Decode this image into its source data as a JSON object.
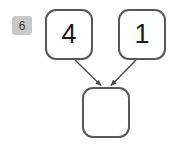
{
  "canvas": {
    "width": 176,
    "height": 152,
    "background": "#ffffff"
  },
  "badge": {
    "name": "step-badge",
    "label": "6",
    "background": "#c9c9c9",
    "text_color": "#3a3a3a"
  },
  "diagram": {
    "type": "node-graph",
    "node_style": {
      "fill": "#ffffff",
      "stroke": "#58585a",
      "stroke_width": 2,
      "corner_radius": 11,
      "text_color": "#1a1a1a"
    },
    "edge_style": {
      "stroke": "#4a4a4a",
      "stroke_width": 1.4,
      "arrowhead": "filled-triangle"
    },
    "nodes": [
      {
        "id": "left",
        "label": "4",
        "x": 45,
        "y": 9,
        "w": 48,
        "h": 51
      },
      {
        "id": "right",
        "label": "1",
        "x": 118,
        "y": 9,
        "w": 48,
        "h": 51
      },
      {
        "id": "out",
        "label": "",
        "x": 82,
        "y": 87,
        "w": 48,
        "h": 51
      }
    ],
    "edges": [
      {
        "from": "left",
        "to": "out",
        "x1": 75,
        "y1": 60,
        "x2": 102,
        "y2": 87
      },
      {
        "from": "right",
        "to": "out",
        "x1": 136,
        "y1": 60,
        "x2": 110,
        "y2": 87
      }
    ]
  }
}
